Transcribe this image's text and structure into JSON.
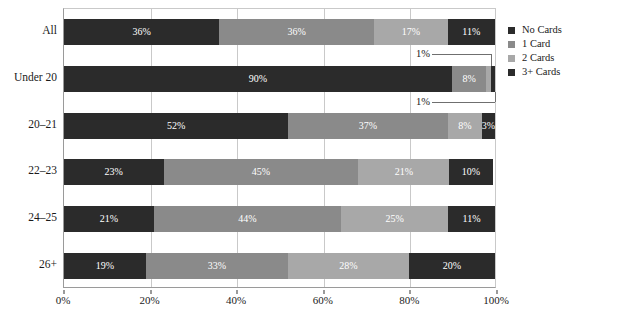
{
  "chart_data": {
    "type": "bar",
    "orientation": "horizontal",
    "stacked": true,
    "normalized": "100%",
    "title": "",
    "xlabel": "",
    "ylabel": "",
    "xlim": [
      0,
      100
    ],
    "xticks": [
      "0%",
      "20%",
      "40%",
      "60%",
      "80%",
      "100%"
    ],
    "xtick_values": [
      0,
      20,
      40,
      60,
      80,
      100
    ],
    "grid": true,
    "grid_axis": "x",
    "legend_position": "right",
    "categories": [
      "All",
      "Under 20",
      "20–21",
      "22–23",
      "24–25",
      "26+"
    ],
    "series": [
      {
        "name": "No Cards",
        "color": "#2b2b2b",
        "values": [
          36,
          90,
          52,
          23,
          21,
          19
        ],
        "labels": [
          "36%",
          "90%",
          "52%",
          "23%",
          "21%",
          "19%"
        ]
      },
      {
        "name": "1 Card",
        "color": "#8a8a8a",
        "values": [
          36,
          8,
          37,
          45,
          44,
          33
        ],
        "labels": [
          "36%",
          "8%",
          "37%",
          "45%",
          "44%",
          "33%"
        ]
      },
      {
        "name": "2 Cards",
        "color": "#a8a8a8",
        "values": [
          17,
          1,
          8,
          21,
          25,
          28
        ],
        "labels": [
          "17%",
          "1%",
          "8%",
          "21%",
          "25%",
          "28%"
        ]
      },
      {
        "name": "3+ Cards",
        "color": "#2b2b2b",
        "values": [
          11,
          1,
          3,
          10,
          11,
          20
        ],
        "labels": [
          "11%",
          "1%",
          "3%",
          "10%",
          "11%",
          "20%"
        ]
      }
    ],
    "callouts": [
      {
        "text": "1%",
        "category": "Under 20",
        "series": "2 Cards"
      },
      {
        "text": "1%",
        "category": "Under 20",
        "series": "3+ Cards"
      }
    ]
  },
  "legend": {
    "items": [
      {
        "label": "No Cards",
        "color": "#2b2b2b"
      },
      {
        "label": "1 Card",
        "color": "#8a8a8a"
      },
      {
        "label": "2 Cards",
        "color": "#a8a8a8"
      },
      {
        "label": "3+ Cards",
        "color": "#2b2b2b"
      }
    ]
  }
}
